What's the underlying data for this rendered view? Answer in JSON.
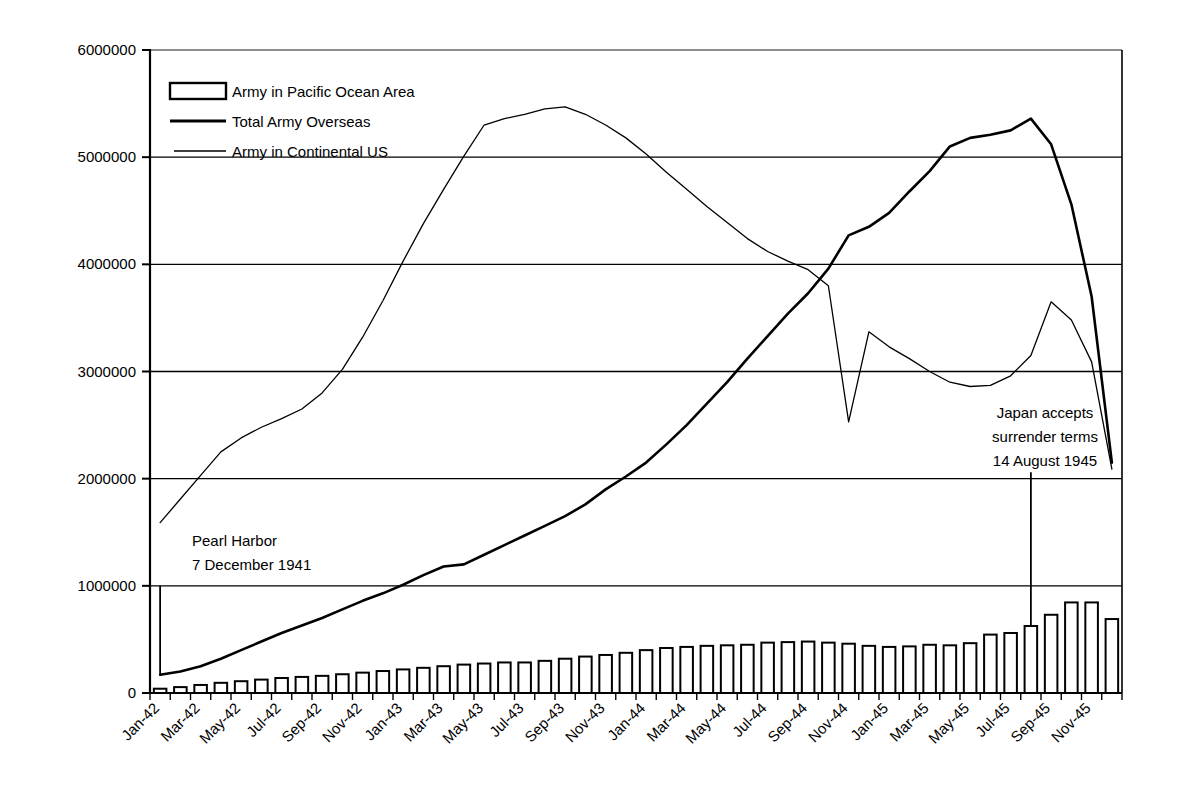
{
  "chart_data": {
    "type": "bar",
    "title": "",
    "subtitle": "",
    "xlabel": "",
    "ylabel": "",
    "ylim": [
      0,
      6000000
    ],
    "ytick_labels": [
      "0",
      "1000000",
      "2000000",
      "3000000",
      "4000000",
      "5000000",
      "6000000"
    ],
    "ytick_values": [
      0,
      1000000,
      2000000,
      3000000,
      4000000,
      5000000,
      6000000
    ],
    "grid": true,
    "grid_axis": "y",
    "legend_position": "top-left",
    "categories": [
      "Jan-42",
      "Feb-42",
      "Mar-42",
      "Apr-42",
      "May-42",
      "Jun-42",
      "Jul-42",
      "Aug-42",
      "Sep-42",
      "Oct-42",
      "Nov-42",
      "Dec-42",
      "Jan-43",
      "Feb-43",
      "Mar-43",
      "Apr-43",
      "May-43",
      "Jun-43",
      "Jul-43",
      "Aug-43",
      "Sep-43",
      "Oct-43",
      "Nov-43",
      "Dec-43",
      "Jan-44",
      "Feb-44",
      "Mar-44",
      "Apr-44",
      "May-44",
      "Jun-44",
      "Jul-44",
      "Aug-44",
      "Sep-44",
      "Oct-44",
      "Nov-44",
      "Dec-44",
      "Jan-45",
      "Feb-45",
      "Mar-45",
      "Apr-45",
      "May-45",
      "Jun-45",
      "Jul-45",
      "Aug-45",
      "Sep-45",
      "Oct-45",
      "Nov-45",
      "Dec-45"
    ],
    "xtick_labels": [
      "Jan-42",
      "Mar-42",
      "May-42",
      "Jul-42",
      "Sep-42",
      "Nov-42",
      "Jan-43",
      "Mar-43",
      "May-43",
      "Jul-43",
      "Sep-43",
      "Nov-43",
      "Jan-44",
      "Mar-44",
      "May-44",
      "Jul-44",
      "Sep-44",
      "Nov-44",
      "Jan-45",
      "Mar-45",
      "May-45",
      "Jul-45",
      "Sep-45",
      "Nov-45"
    ],
    "series": [
      {
        "name": "Army in Pacific Ocean Area",
        "render": "bar",
        "values": [
          40000,
          55000,
          75000,
          95000,
          110000,
          125000,
          140000,
          150000,
          160000,
          175000,
          190000,
          205000,
          220000,
          235000,
          250000,
          265000,
          275000,
          285000,
          285000,
          300000,
          320000,
          340000,
          355000,
          375000,
          400000,
          420000,
          430000,
          440000,
          445000,
          450000,
          470000,
          475000,
          480000,
          470000,
          460000,
          440000,
          430000,
          435000,
          450000,
          445000,
          465000,
          545000,
          560000,
          625000,
          730000,
          845000,
          845000,
          690000
        ]
      },
      {
        "name": "Total Army Overseas",
        "render": "line",
        "values": [
          170000,
          200000,
          250000,
          320000,
          400000,
          480000,
          560000,
          630000,
          700000,
          780000,
          860000,
          930000,
          1010000,
          1100000,
          1180000,
          1200000,
          1290000,
          1380000,
          1470000,
          1560000,
          1650000,
          1760000,
          1900000,
          2020000,
          2150000,
          2320000,
          2500000,
          2700000,
          2900000,
          3120000,
          3330000,
          3540000,
          3730000,
          3960000,
          4270000,
          4350000,
          4480000,
          4680000,
          4870000,
          5100000,
          5180000,
          5210000,
          5250000,
          5360000,
          5120000,
          4560000,
          3700000,
          2150000
        ]
      },
      {
        "name": "Army in Continental US",
        "render": "line",
        "values": [
          1590000,
          1810000,
          2030000,
          2250000,
          2380000,
          2480000,
          2560000,
          2650000,
          2800000,
          3020000,
          3320000,
          3660000,
          4030000,
          4380000,
          4700000,
          5010000,
          5300000,
          5360000,
          5400000,
          5450000,
          5470000,
          5400000,
          5300000,
          5180000,
          5030000,
          4860000,
          4700000,
          4540000,
          4390000,
          4240000,
          4120000,
          4030000,
          3950000,
          3800000,
          2530000,
          3370000,
          3230000,
          3120000,
          3000000,
          2900000,
          2860000,
          2870000,
          2960000,
          3150000,
          3650000,
          3480000,
          3090000,
          2090000
        ]
      }
    ],
    "annotations": [
      {
        "name": "pearl-harbor",
        "lines": [
          "Pearl Harbor",
          "7 December 1941"
        ],
        "marker_category": "Jan-42",
        "marker_top_value": 1000000,
        "marker_bottom_value": 170000
      },
      {
        "name": "japan-surrender",
        "lines": [
          "Japan accepts",
          "surrender terms",
          "14 August 1945"
        ],
        "marker_category": "Aug-45",
        "marker_top_value": 2060000,
        "marker_bottom_value": 625000
      }
    ]
  },
  "legend": {
    "items": [
      {
        "label": "Army in Pacific Ocean Area",
        "marker": "bar-swatch"
      },
      {
        "label": "Total Army Overseas",
        "marker": "thick-line-swatch"
      },
      {
        "label": "Army in Continental US",
        "marker": "thin-line-swatch"
      }
    ]
  },
  "colors": {
    "ink": "#000000",
    "background": "#ffffff",
    "grid": "#000000"
  }
}
